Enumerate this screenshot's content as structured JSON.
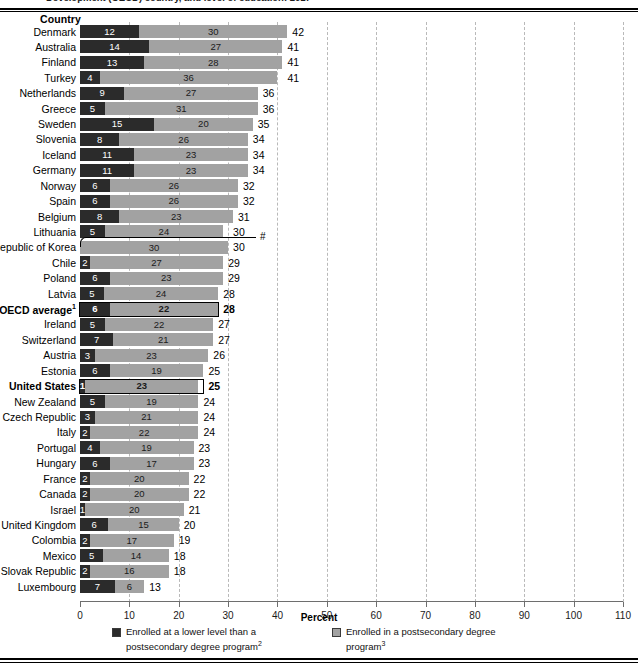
{
  "top_title": "Development (OECD) country, and level of education: 2017",
  "column_header": "Country",
  "axis_title": "Percent",
  "korea_note_symbol": "#",
  "colors": {
    "dark_segment": "#2b2b2b",
    "light_segment": "#a2a2a2",
    "gridline": "#b9b9b9",
    "axis": "#6e6e6e",
    "background": "#ffffff"
  },
  "legend": [
    {
      "swatch": "dark",
      "text": "Enrolled at a lower level than a postsecondary degree program",
      "footnote": "2"
    },
    {
      "swatch": "light",
      "text": "Enrolled in a postsecondary degree program",
      "footnote": "3"
    }
  ],
  "chart_data": {
    "type": "bar",
    "orientation": "horizontal",
    "stacked": true,
    "title": "Development (OECD) country, and level of education: 2017",
    "xlabel": "Percent",
    "ylabel": "Country",
    "xlim": [
      0,
      110
    ],
    "xticks": [
      0,
      10,
      20,
      30,
      40,
      50,
      60,
      70,
      80,
      90,
      100,
      110
    ],
    "grid": "vertical-dashed",
    "legend_position": "bottom",
    "series": [
      {
        "name": "Enrolled at a lower level than a postsecondary degree program",
        "key": "lower",
        "color": "#2b2b2b"
      },
      {
        "name": "Enrolled in a postsecondary degree program",
        "key": "postsecondary",
        "color": "#a2a2a2"
      }
    ],
    "categories": [
      "Denmark",
      "Australia",
      "Finland",
      "Turkey",
      "Netherlands",
      "Greece",
      "Sweden",
      "Slovenia",
      "Iceland",
      "Germany",
      "Norway",
      "Spain",
      "Belgium",
      "Lithuania",
      "Republic of Korea",
      "Chile",
      "Poland",
      "Latvia",
      "OECD average",
      "Ireland",
      "Switzerland",
      "Austria",
      "Estonia",
      "United States",
      "New Zealand",
      "Czech Republic",
      "Italy",
      "Portugal",
      "Hungary",
      "France",
      "Canada",
      "Israel",
      "United Kingdom",
      "Colombia",
      "Mexico",
      "Slovak Republic",
      "Luxembourg"
    ],
    "rows": [
      {
        "country": "Denmark",
        "lower": 12,
        "postsecondary": 30,
        "total": 42,
        "bold": false
      },
      {
        "country": "Australia",
        "lower": 14,
        "postsecondary": 27,
        "total": 41,
        "bold": false
      },
      {
        "country": "Finland",
        "lower": 13,
        "postsecondary": 28,
        "total": 41,
        "bold": false
      },
      {
        "country": "Turkey",
        "lower": 4,
        "postsecondary": 36,
        "total": 41,
        "bold": false
      },
      {
        "country": "Netherlands",
        "lower": 9,
        "postsecondary": 27,
        "total": 36,
        "bold": false
      },
      {
        "country": "Greece",
        "lower": 5,
        "postsecondary": 31,
        "total": 36,
        "bold": false
      },
      {
        "country": "Sweden",
        "lower": 15,
        "postsecondary": 20,
        "total": 35,
        "bold": false
      },
      {
        "country": "Slovenia",
        "lower": 8,
        "postsecondary": 26,
        "total": 34,
        "bold": false
      },
      {
        "country": "Iceland",
        "lower": 11,
        "postsecondary": 23,
        "total": 34,
        "bold": false
      },
      {
        "country": "Germany",
        "lower": 11,
        "postsecondary": 23,
        "total": 34,
        "bold": false
      },
      {
        "country": "Norway",
        "lower": 6,
        "postsecondary": 26,
        "total": 32,
        "bold": false
      },
      {
        "country": "Spain",
        "lower": 6,
        "postsecondary": 26,
        "total": 32,
        "bold": false
      },
      {
        "country": "Belgium",
        "lower": 8,
        "postsecondary": 23,
        "total": 31,
        "bold": false
      },
      {
        "country": "Lithuania",
        "lower": 5,
        "postsecondary": 24,
        "total": 30,
        "bold": false
      },
      {
        "country": "Republic of Korea",
        "lower": 0,
        "postsecondary": 30,
        "total": 30,
        "bold": false,
        "callout": true
      },
      {
        "country": "Chile",
        "lower": 2,
        "postsecondary": 27,
        "total": 29,
        "bold": false
      },
      {
        "country": "Poland",
        "lower": 6,
        "postsecondary": 23,
        "total": 29,
        "bold": false
      },
      {
        "country": "Latvia",
        "lower": 5,
        "postsecondary": 24,
        "total": 28,
        "bold": false
      },
      {
        "country": "OECD average",
        "lower": 6,
        "postsecondary": 22,
        "total": 28,
        "bold": true,
        "footnote": "1"
      },
      {
        "country": "Ireland",
        "lower": 5,
        "postsecondary": 22,
        "total": 27,
        "bold": false
      },
      {
        "country": "Switzerland",
        "lower": 7,
        "postsecondary": 21,
        "total": 27,
        "bold": false
      },
      {
        "country": "Austria",
        "lower": 3,
        "postsecondary": 23,
        "total": 26,
        "bold": false
      },
      {
        "country": "Estonia",
        "lower": 6,
        "postsecondary": 19,
        "total": 25,
        "bold": false
      },
      {
        "country": "United States",
        "lower": 1,
        "postsecondary": 23,
        "total": 25,
        "bold": true
      },
      {
        "country": "New Zealand",
        "lower": 5,
        "postsecondary": 19,
        "total": 24,
        "bold": false
      },
      {
        "country": "Czech Republic",
        "lower": 3,
        "postsecondary": 21,
        "total": 24,
        "bold": false
      },
      {
        "country": "Italy",
        "lower": 2,
        "postsecondary": 22,
        "total": 24,
        "bold": false
      },
      {
        "country": "Portugal",
        "lower": 4,
        "postsecondary": 19,
        "total": 23,
        "bold": false
      },
      {
        "country": "Hungary",
        "lower": 6,
        "postsecondary": 17,
        "total": 23,
        "bold": false
      },
      {
        "country": "France",
        "lower": 2,
        "postsecondary": 20,
        "total": 22,
        "bold": false
      },
      {
        "country": "Canada",
        "lower": 2,
        "postsecondary": 20,
        "total": 22,
        "bold": false
      },
      {
        "country": "Israel",
        "lower": 1,
        "postsecondary": 20,
        "total": 21,
        "bold": false
      },
      {
        "country": "United Kingdom",
        "lower": 6,
        "postsecondary": 15,
        "total": 20,
        "bold": false
      },
      {
        "country": "Colombia",
        "lower": 2,
        "postsecondary": 17,
        "total": 19,
        "bold": false
      },
      {
        "country": "Mexico",
        "lower": 5,
        "postsecondary": 14,
        "total": 18,
        "bold": false
      },
      {
        "country": "Slovak Republic",
        "lower": 2,
        "postsecondary": 16,
        "total": 18,
        "bold": false
      },
      {
        "country": "Luxembourg",
        "lower": 7,
        "postsecondary": 6,
        "total": 13,
        "bold": false
      }
    ]
  }
}
